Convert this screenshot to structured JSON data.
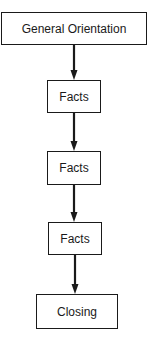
{
  "diagram": {
    "type": "flowchart",
    "direction": "top-to-bottom",
    "nodes": [
      {
        "id": "n0",
        "label": "General Orientation"
      },
      {
        "id": "n1",
        "label": "Facts"
      },
      {
        "id": "n2",
        "label": "Facts"
      },
      {
        "id": "n3",
        "label": "Facts"
      },
      {
        "id": "n4",
        "label": "Closing"
      }
    ],
    "edges": [
      {
        "from": "n0",
        "to": "n1"
      },
      {
        "from": "n1",
        "to": "n2"
      },
      {
        "from": "n2",
        "to": "n3"
      },
      {
        "from": "n3",
        "to": "n4"
      }
    ],
    "colors": {
      "stroke": "#1a1a1a",
      "background": "#ffffff"
    }
  }
}
